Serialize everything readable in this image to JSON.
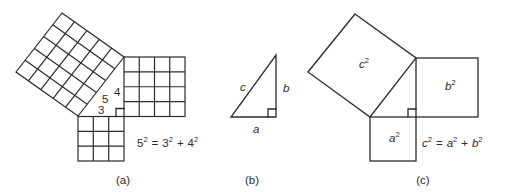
{
  "figures": [
    {
      "id": "a",
      "caption": "(a)",
      "side_labels": {
        "hyp": "5",
        "vertical": "4",
        "horizontal": "3"
      },
      "equation": {
        "lhs_base": "5",
        "lhs_exp": "2",
        "eq": "=",
        "t1_base": "3",
        "t1_exp": "2",
        "plus": "+",
        "t2_base": "4",
        "t2_exp": "2"
      },
      "grids": {
        "hyp_square": 5,
        "vertical_square": 4,
        "horizontal_square": 3
      }
    },
    {
      "id": "b",
      "caption": "(b)",
      "side_labels": {
        "hyp": "c",
        "vertical": "b",
        "horizontal": "a"
      }
    },
    {
      "id": "c",
      "caption": "(c)",
      "square_labels": {
        "hyp": {
          "base": "c",
          "exp": "2"
        },
        "vertical": {
          "base": "b",
          "exp": "2"
        },
        "horizontal": {
          "base": "a",
          "exp": "2"
        }
      },
      "equation": {
        "lhs_base": "c",
        "lhs_exp": "2",
        "eq": "=",
        "t1_base": "a",
        "t1_exp": "2",
        "plus": "+",
        "t2_base": "b",
        "t2_exp": "2"
      }
    }
  ]
}
